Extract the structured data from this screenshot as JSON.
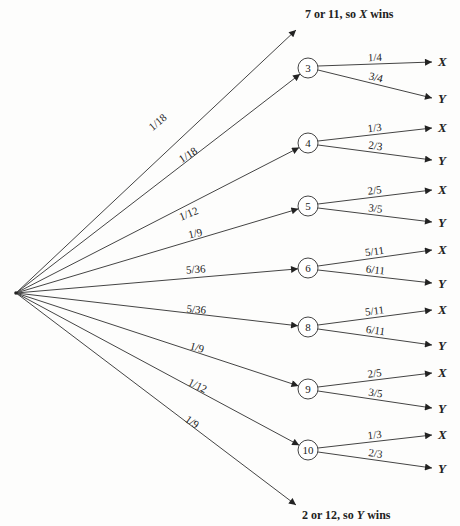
{
  "diagram": {
    "type": "probability-tree",
    "root": {
      "x": 16,
      "y": 293
    },
    "terminals": [
      {
        "id": "top",
        "text_plain": "7 or 11, so ",
        "text_italic": "X",
        "text_end": " wins",
        "prob": "1/18",
        "end": {
          "x": 296,
          "y": 30
        },
        "label_pos": {
          "x": 305,
          "y": 18
        },
        "prob_pos": {
          "x": 160,
          "y": 125
        },
        "prob_angle": -40
      },
      {
        "id": "bottom",
        "text_plain": "2 or 12, so ",
        "text_italic": "Y",
        "text_end": " wins",
        "prob": "1/9",
        "end": {
          "x": 296,
          "y": 505
        },
        "label_pos": {
          "x": 302,
          "y": 519
        },
        "prob_pos": {
          "x": 190,
          "y": 425
        },
        "prob_angle": 35
      }
    ],
    "nodes": [
      {
        "label": "3",
        "prob": "1/18",
        "x": 308,
        "y": 68,
        "prob_pos": {
          "x": 190,
          "y": 158
        },
        "prob_angle": -33,
        "x_prob": "1/4",
        "y_prob": "3/4",
        "x_end": {
          "x": 432,
          "y": 62
        },
        "y_end": {
          "x": 432,
          "y": 98
        }
      },
      {
        "label": "4",
        "prob": "1/12",
        "x": 308,
        "y": 143,
        "prob_pos": {
          "x": 190,
          "y": 217
        },
        "prob_angle": -22,
        "x_prob": "1/3",
        "y_prob": "2/3",
        "x_end": {
          "x": 432,
          "y": 128
        },
        "y_end": {
          "x": 432,
          "y": 160
        }
      },
      {
        "label": "5",
        "prob": "1/9",
        "x": 308,
        "y": 206,
        "prob_pos": {
          "x": 196,
          "y": 237
        },
        "prob_angle": -13,
        "x_prob": "2/5",
        "y_prob": "3/5",
        "x_end": {
          "x": 432,
          "y": 190
        },
        "y_end": {
          "x": 432,
          "y": 222
        }
      },
      {
        "label": "6",
        "prob": "5/36",
        "x": 308,
        "y": 268,
        "prob_pos": {
          "x": 196,
          "y": 273
        },
        "prob_angle": -4,
        "x_prob": "5/11",
        "y_prob": "6/11",
        "x_end": {
          "x": 432,
          "y": 250
        },
        "y_end": {
          "x": 432,
          "y": 283
        }
      },
      {
        "label": "8",
        "prob": "5/36",
        "x": 308,
        "y": 327,
        "prob_pos": {
          "x": 196,
          "y": 313
        },
        "prob_angle": 5,
        "x_prob": "5/11",
        "y_prob": "6/11",
        "x_end": {
          "x": 432,
          "y": 310
        },
        "y_end": {
          "x": 432,
          "y": 345
        }
      },
      {
        "label": "9",
        "prob": "1/9",
        "x": 308,
        "y": 389,
        "prob_pos": {
          "x": 196,
          "y": 351
        },
        "prob_angle": 16,
        "x_prob": "2/5",
        "y_prob": "3/5",
        "x_end": {
          "x": 432,
          "y": 373
        },
        "y_end": {
          "x": 432,
          "y": 408
        }
      },
      {
        "label": "10",
        "prob": "1/12",
        "x": 308,
        "y": 450,
        "prob_pos": {
          "x": 196,
          "y": 389
        },
        "prob_angle": 26,
        "x_prob": "1/3",
        "y_prob": "2/3",
        "x_end": {
          "x": 432,
          "y": 435
        },
        "y_end": {
          "x": 432,
          "y": 468
        }
      }
    ],
    "outcome_labels": {
      "x": "X",
      "y": "Y"
    },
    "colors": {
      "line": "#444444",
      "text": "#222222",
      "background": "#fdfdfc"
    }
  }
}
